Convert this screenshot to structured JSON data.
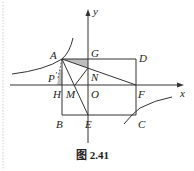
{
  "figure": {
    "caption": "图 2.41",
    "axes": {
      "x_label": "x",
      "y_label": "y"
    },
    "points": {
      "A": "A",
      "G": "G",
      "D": "D",
      "P": "P",
      "P_prime": "′",
      "N": "N",
      "H": "H",
      "M": "M",
      "O": "O",
      "F": "F",
      "B": "B",
      "E": "E",
      "C": "C"
    },
    "colors": {
      "line": "#333333",
      "shade": "#bdbdbd",
      "border": "#cccccc"
    }
  }
}
